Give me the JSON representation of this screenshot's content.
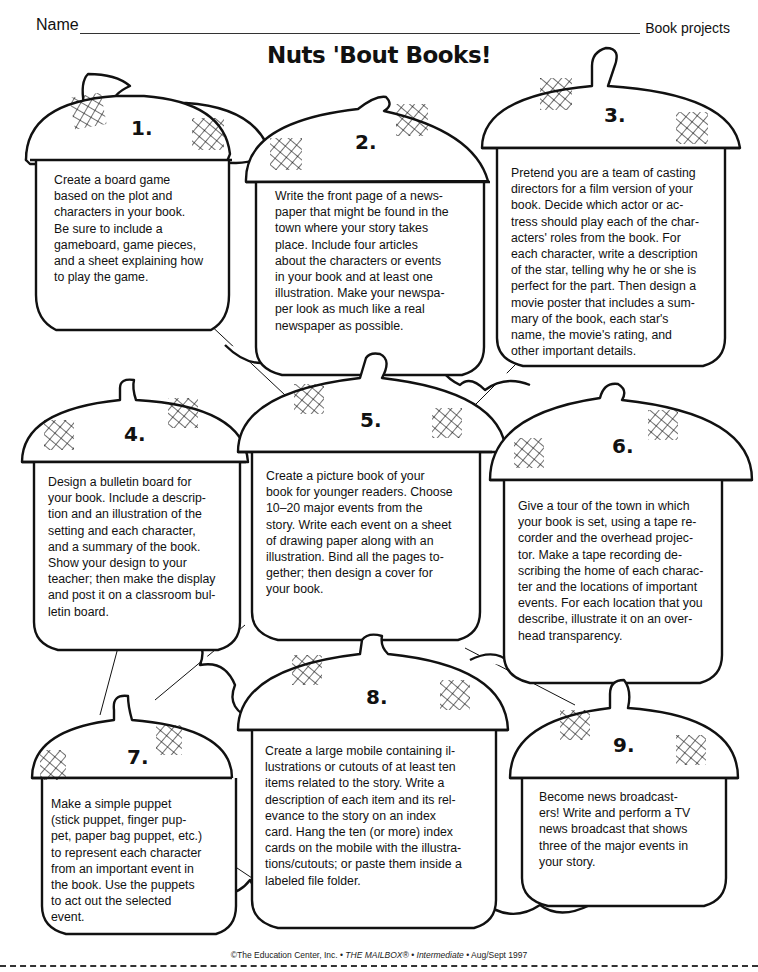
{
  "header": {
    "name_label": "Name",
    "category": "Book projects"
  },
  "title": "Nuts 'Bout Books!",
  "projects": [
    {
      "number": "1.",
      "text": "Create a board game\nbased on the plot and\ncharacters in your book.\nBe sure to include a\ngameboard, game pieces,\nand a sheet explaining how\nto play the game."
    },
    {
      "number": "2.",
      "text": "Write the front page of a news-\npaper that might be found in the\ntown where your story takes\nplace. Include four articles\nabout the characters or events\nin your book and at least one\nillustration. Make your newspa-\nper look as much like a real\nnewspaper as possible."
    },
    {
      "number": "3.",
      "text": "Pretend you are a team of casting\ndirectors for a film version of your\nbook. Decide which actor or ac-\ntress should play each of the char-\nacters' roles from the book. For\neach character, write a description\nof the star, telling why he or she is\nperfect for the part. Then design a\nmovie poster that includes a sum-\nmary of the book, each star's\nname, the movie's rating, and\n   other important details."
    },
    {
      "number": "4.",
      "text": "Design a bulletin board for\nyour book. Include a descrip-\ntion and an illustration of the\nsetting and each character,\nand a summary of the book.\nShow your design to your\nteacher; then make the display\nand post it on a classroom bul-\nletin board."
    },
    {
      "number": "5.",
      "text": "Create a picture book of your\nbook for younger readers. Choose\n10–20 major events from the\nstory. Write each event on a sheet\nof drawing paper along with an\nillustration. Bind all the pages to-\ngether; then design a cover for\nyour book."
    },
    {
      "number": "6.",
      "text": "Give a tour of the town in which\nyour book is set, using a tape re-\ncorder and the overhead projec-\ntor. Make a tape recording de-\nscribing the home of each charac-\nter and the locations of important\nevents. For each location that you\ndescribe, illustrate it on an over-\nhead transparency."
    },
    {
      "number": "7.",
      "text": "Make a simple puppet\n(stick puppet, finger pup-\npet, paper bag puppet, etc.)\nto represent each character\nfrom an important event in\nthe book. Use the puppets\nto act out the selected\nevent."
    },
    {
      "number": "8.",
      "text": "Create a large mobile containing il-\nlustrations or cutouts of at least ten\nitems related to the story. Write a\ndescription of each item and its rel-\nevance to the story on an index\ncard. Hang the ten (or more) index\ncards on the mobile with the illustra-\ntions/cutouts; or paste them inside a\nlabeled file folder."
    },
    {
      "number": "9.",
      "text": "Become news broadcast-\ners! Write and perform a TV\nnews broadcast that shows\nthree of the major events in\nyour story."
    }
  ],
  "footer": {
    "copyright": "©The Education Center, Inc. •",
    "magazine": "THE MAILBOX®",
    "sep": "•",
    "level": "Intermediate",
    "date": "• Aug/Sept 1997"
  }
}
